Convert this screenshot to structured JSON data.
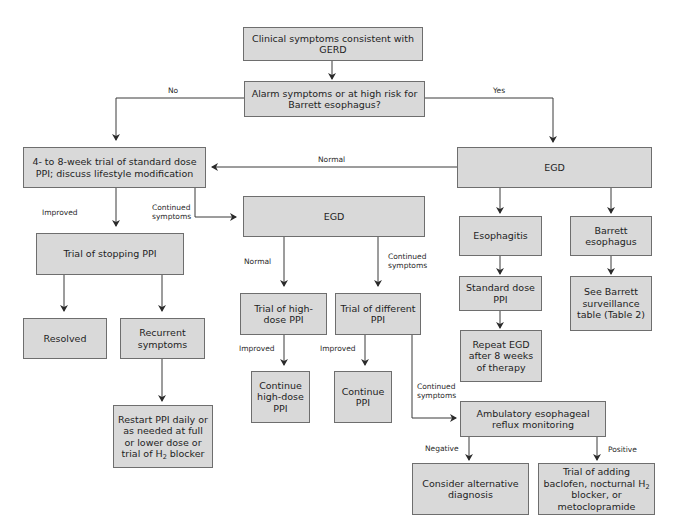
{
  "diagram": {
    "nodes": {
      "start": "Clinical symptoms consistent with GERD",
      "alarm": "Alarm symptoms or at high risk for Barrett esophagus?",
      "ppi_trial": "4- to 8-week trial of standard dose PPI; discuss lifestyle modification",
      "egd_top": "EGD",
      "egd_mid": "EGD",
      "stop_ppi": "Trial of stopping PPI",
      "resolved": "Resolved",
      "recurrent": "Recurrent symptoms",
      "restart_a": "Restart PPI daily or as needed at full or lower dose or trial of H",
      "restart_sub": "2",
      "restart_b": " blocker",
      "high_dose": "Trial of high-dose PPI",
      "different_ppi": "Trial of different PPI",
      "continue_high": "Continue high-dose PPI",
      "continue_ppi": "Continue PPI",
      "esophagitis": "Esophagitis",
      "barrett": "Barrett esophagus",
      "standard_dose": "Standard dose PPI",
      "see_barrett": "See Barrett surveillance table (Table 2)",
      "repeat_egd": "Repeat EGD after 8 weeks of therapy",
      "ambulatory": "Ambulatory esophageal reflux monitoring",
      "alternative": "Consider alternative diagnosis",
      "baclofen_a": "Trial of adding baclofen, nocturnal H",
      "baclofen_sub": "2",
      "baclofen_b": " blocker, or metoclopramide"
    },
    "labels": {
      "no": "No",
      "yes": "Yes",
      "normal_top": "Normal",
      "improved_1": "Improved",
      "continued_1": "Continued symptoms",
      "normal_mid": "Normal",
      "continued_2": "Continued symptoms",
      "improved_2": "Improved",
      "improved_3": "Improved",
      "continued_3": "Continued symptoms",
      "negative": "Negative",
      "positive": "Positive"
    },
    "colors": {
      "box_fill": "#d9d9d9",
      "box_border": "#6e6e6e",
      "line": "#3a3a3a"
    }
  }
}
